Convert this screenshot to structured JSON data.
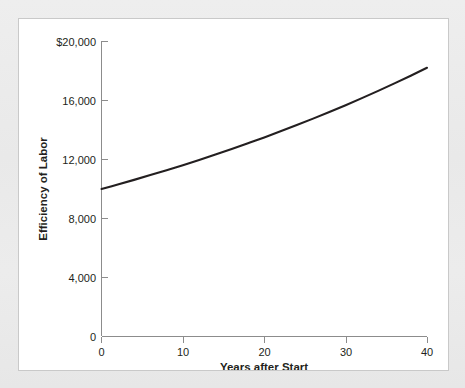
{
  "figure": {
    "background_color": "#ffffff",
    "page_background_color": "#ebeaea",
    "border_color": "#c9c9c9"
  },
  "chart_data": {
    "type": "line",
    "title": "",
    "xlabel": "Years after Start",
    "ylabel": "Efficiency of Labor",
    "xlim": [
      0,
      40
    ],
    "ylim": [
      0,
      20000
    ],
    "xticks": [
      0,
      10,
      20,
      30,
      40
    ],
    "xtick_labels": [
      "0",
      "10",
      "20",
      "30",
      "40"
    ],
    "yticks": [
      0,
      4000,
      8000,
      12000,
      16000,
      20000
    ],
    "ytick_labels": [
      "0",
      "4,000",
      "8,000",
      "12,000",
      "16,000",
      "$20,000"
    ],
    "grid": false,
    "legend": null,
    "series": [
      {
        "name": "Efficiency of Labor",
        "color": "#231f20",
        "line_width": 2.1,
        "x": [
          0,
          2,
          4,
          6,
          8,
          10,
          12,
          14,
          16,
          18,
          20,
          22,
          24,
          26,
          28,
          30,
          32,
          34,
          36,
          38,
          40
        ],
        "values": [
          10000,
          10305,
          10618,
          10942,
          11275,
          11618,
          11972,
          12337,
          12712,
          13100,
          13499,
          13910,
          14333,
          14770,
          15220,
          15683,
          16161,
          16653,
          17160,
          17683,
          18221
        ]
      }
    ],
    "annotations": []
  },
  "axis_labels": {
    "y_title": "Efficiency of Labor",
    "x_title": "Years after Start"
  }
}
